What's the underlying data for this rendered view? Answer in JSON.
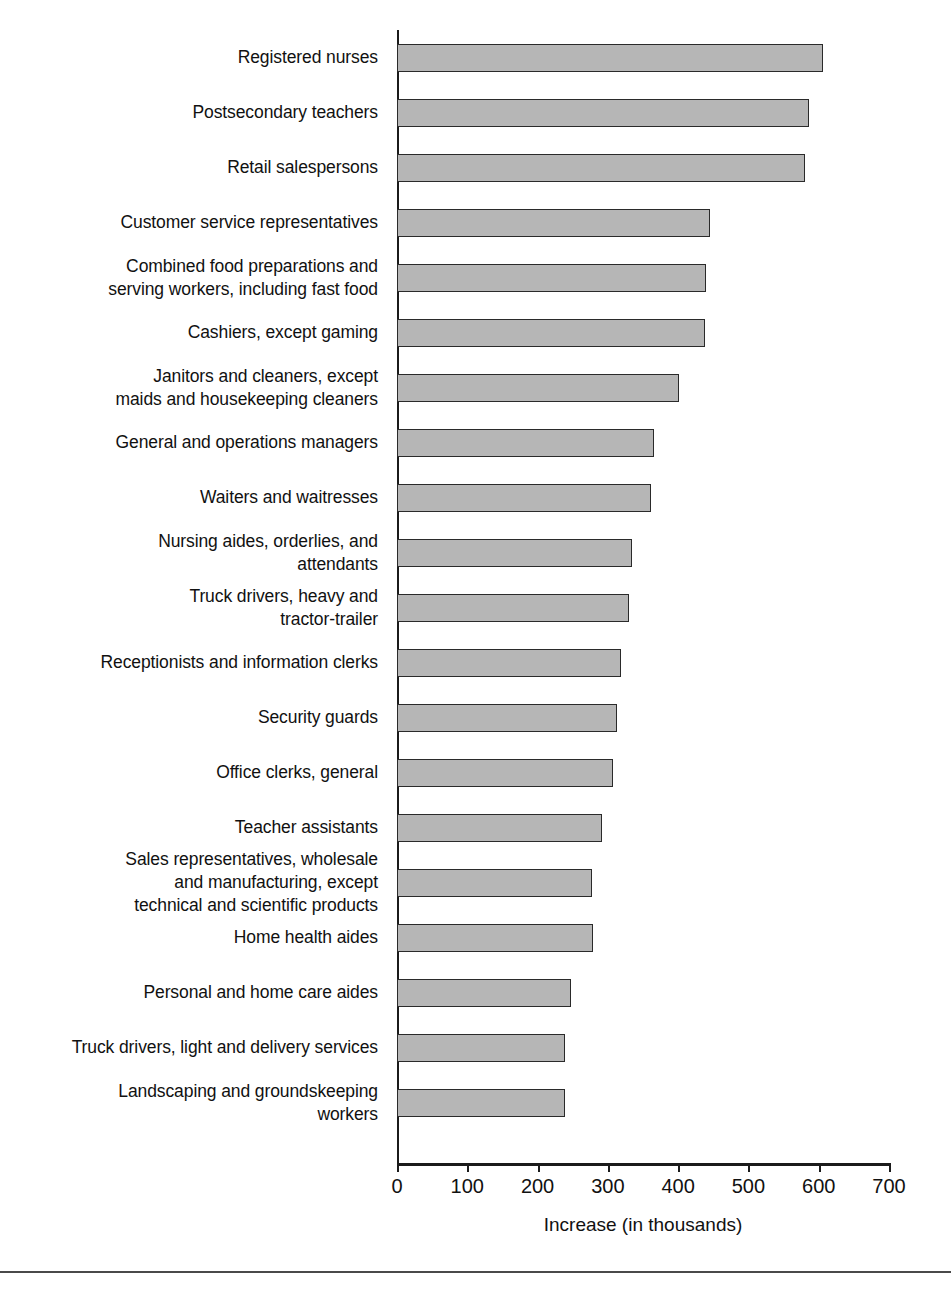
{
  "chart_data": {
    "type": "bar",
    "orientation": "horizontal",
    "title": "",
    "xlabel": "Increase (in thousands)",
    "ylabel": "",
    "xlim": [
      0,
      700
    ],
    "xticks": [
      0,
      100,
      200,
      300,
      400,
      500,
      600,
      700
    ],
    "xtick_labels": [
      "0",
      "100",
      "200",
      "300",
      "400",
      "500",
      "600",
      "700"
    ],
    "grid": false,
    "legend": false,
    "bar_fill_color": "#b6b6b6",
    "bar_edge_color": "#2a2a2a",
    "categories": [
      "Registered nurses",
      "Postsecondary teachers",
      "Retail salespersons",
      "Customer service representatives",
      "Combined food preparations and\nserving workers, including fast food",
      "Cashiers, except gaming",
      "Janitors and cleaners, except\nmaids and housekeeping cleaners",
      "General and operations managers",
      "Waiters and waitresses",
      "Nursing aides, orderlies, and\nattendants",
      "Truck drivers, heavy and\ntractor-trailer",
      "Receptionists and information clerks",
      "Security guards",
      "Office clerks, general",
      "Teacher assistants",
      "Sales representatives, wholesale\nand manufacturing, except\ntechnical and scientific products",
      "Home health aides",
      "Personal and home care aides",
      "Truck drivers, light and delivery services",
      "Landscaping and groundskeeping\nworkers"
    ],
    "values": [
      606,
      586,
      581,
      445,
      439,
      438,
      401,
      365,
      362,
      335,
      330,
      318,
      313,
      307,
      292,
      277,
      279,
      247,
      239,
      239
    ]
  }
}
